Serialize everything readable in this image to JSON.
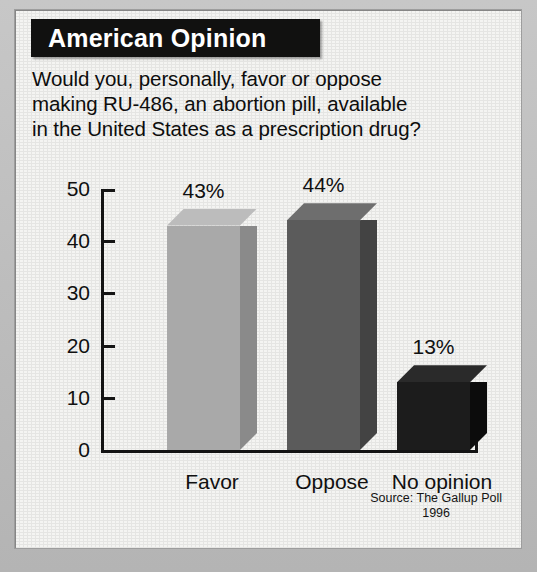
{
  "banner": {
    "title": "American Opinion"
  },
  "question": {
    "line1": "Would you, personally, favor or oppose",
    "line2": "making RU-486, an abortion pill, available",
    "line3": "in the United States as a prescription drug?"
  },
  "source": {
    "line1": "Source:  The Gallup Poll",
    "line2": "1996"
  },
  "colors": {
    "banner_background": "#111110",
    "banner_text": "#ffffff",
    "card_background": "#f4f4f2",
    "frame_background": "#bdbdbd",
    "axis": "#141414",
    "bar_favor_front": "#a9a9a9",
    "bar_favor_side": "#8a8a8a",
    "bar_favor_top": "#bcbcbc",
    "bar_oppose_front": "#5b5b5b",
    "bar_oppose_side": "#434343",
    "bar_oppose_top": "#6e6e6e",
    "bar_noopinion_front": "#1c1c1c",
    "bar_noopinion_side": "#0c0c0c",
    "bar_noopinion_top": "#2a2a2a"
  },
  "chart_data": {
    "type": "bar",
    "title": "American Opinion",
    "subtitle": "Would you, personally, favor or oppose making RU-486, an abortion pill, available in the United States as a prescription drug?",
    "categories": [
      "Favor",
      "Oppose",
      "No opinion"
    ],
    "values": [
      43,
      44,
      13
    ],
    "value_labels": [
      "43%",
      "44%",
      "13%"
    ],
    "xlabel": "",
    "ylabel": "",
    "ylim": [
      0,
      50
    ],
    "yticks": [
      0,
      10,
      20,
      30,
      40,
      50
    ],
    "ytick_labels": [
      "0",
      "10",
      "20",
      "30",
      "40",
      "50"
    ],
    "grid": false,
    "legend": "none",
    "style": "3d-bar",
    "units": "percent",
    "source": "Source:  The Gallup Poll 1996"
  }
}
